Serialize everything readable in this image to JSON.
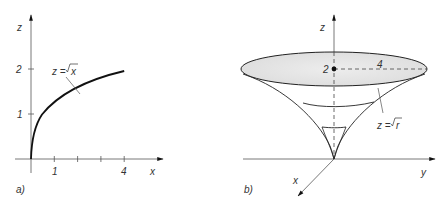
{
  "panel_a": {
    "label": "a)",
    "z_axis_label": "z",
    "x_axis_label": "x",
    "x_ticks": [
      {
        "value": 1,
        "label": "1"
      },
      {
        "value": 2,
        "label": ""
      },
      {
        "value": 3,
        "label": ""
      },
      {
        "value": 4,
        "label": "4"
      }
    ],
    "z_ticks": [
      {
        "value": 1,
        "label": "1"
      },
      {
        "value": 2,
        "label": "2"
      }
    ],
    "curve_label": "z = √x",
    "curve_label_lhs": "z =",
    "curve_label_rhs": "x",
    "curve": "z = sqrt(x), x from 0 to 4"
  },
  "panel_b": {
    "label": "b)",
    "z_axis_label": "z",
    "y_axis_label": "y",
    "x_axis_label": "x",
    "center_height_label": "2",
    "radius_label": "4",
    "surface_label": "z = √r",
    "surface_label_lhs": "z =",
    "surface_label_rhs": "r",
    "fill_color": "#e6e6e6",
    "line_color": "#222222"
  }
}
